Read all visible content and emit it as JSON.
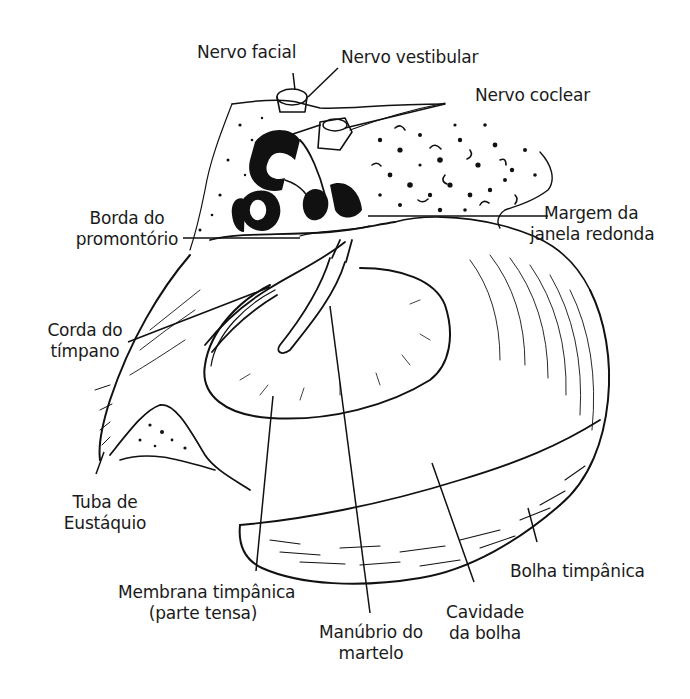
{
  "figure": {
    "type": "anatomical-illustration",
    "labels": [
      {
        "id": "nervo-facial",
        "lines": [
          "Nervo facial"
        ]
      },
      {
        "id": "nervo-vestibular",
        "lines": [
          "Nervo vestibular"
        ]
      },
      {
        "id": "nervo-coclear",
        "lines": [
          "Nervo coclear"
        ]
      },
      {
        "id": "borda-promontorio",
        "lines": [
          "Borda do",
          "promontório"
        ]
      },
      {
        "id": "margem-janela-redonda",
        "lines": [
          "Margem da",
          "janela redonda"
        ]
      },
      {
        "id": "corda-timpano",
        "lines": [
          "Corda do",
          "tímpano"
        ]
      },
      {
        "id": "tuba-eustaquio",
        "lines": [
          "Tuba de",
          "Eustáquio"
        ]
      },
      {
        "id": "membrana-timpanica",
        "lines": [
          "Membrana timpânica",
          "(parte tensa)"
        ]
      },
      {
        "id": "manubrio-martelo",
        "lines": [
          "Manúbrio do",
          "martelo"
        ]
      },
      {
        "id": "cavidade-bolha",
        "lines": [
          "Cavidade",
          "da bolha"
        ]
      },
      {
        "id": "bolha-timpanica",
        "lines": [
          "Bolha timpânica"
        ]
      }
    ]
  },
  "labels": {
    "nervo_facial": "Nervo facial",
    "nervo_vestibular": "Nervo vestibular",
    "nervo_coclear": "Nervo coclear",
    "borda_promontorio_1": "Borda do",
    "borda_promontorio_2": "promontório",
    "margem_janela_1": "Margem da",
    "margem_janela_2": "janela redonda",
    "corda_timpano_1": "Corda do",
    "corda_timpano_2": "tímpano",
    "tuba_1": "Tuba de",
    "tuba_2": "Eustáquio",
    "membrana_1": "Membrana timpânica",
    "membrana_2": "(parte tensa)",
    "manubrio_1": "Manúbrio do",
    "manubrio_2": "martelo",
    "cavidade_1": "Cavidade",
    "cavidade_2": "da bolha",
    "bolha_timpanica": "Bolha timpânica"
  },
  "colors": {
    "ink": "#111111",
    "background": "#ffffff"
  }
}
